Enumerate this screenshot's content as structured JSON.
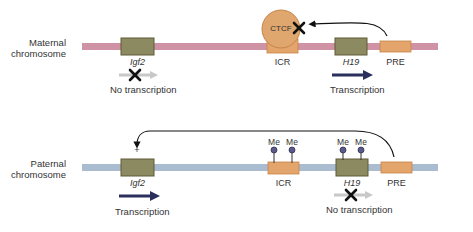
{
  "colors": {
    "maternal_chromosome": "#cf93a5",
    "paternal_chromosome": "#a9bcd0",
    "gene_box": "#8c8a60",
    "gene_box_border": "#5e5a36",
    "regulatory": "#e3a56b",
    "regulatory_border": "#c7844a",
    "ctcf": "#dfa66d",
    "arrow_active": "#2b2f5c",
    "arrow_inactive": "#c8c8c8",
    "methyl": "#5a5a8a"
  },
  "maternal": {
    "label_line1": "Maternal",
    "label_line2": "chromosome",
    "igf2_label": "Igf2",
    "igf2_status": "No transcription",
    "ctcf_label": "CTCF",
    "icr_label": "ICR",
    "h19_label": "H19",
    "h19_status": "Transcription",
    "pre_label": "PRE"
  },
  "paternal": {
    "label_line1": "Paternal",
    "label_line2": "chromosome",
    "igf2_label": "Igf2",
    "igf2_plus": "+",
    "igf2_status": "Transcription",
    "icr_label": "ICR",
    "icr_methyl": [
      "Me",
      "Me"
    ],
    "h19_label": "H19",
    "h19_methyl": [
      "Me",
      "Me"
    ],
    "h19_status": "No transcription",
    "pre_label": "PRE"
  }
}
